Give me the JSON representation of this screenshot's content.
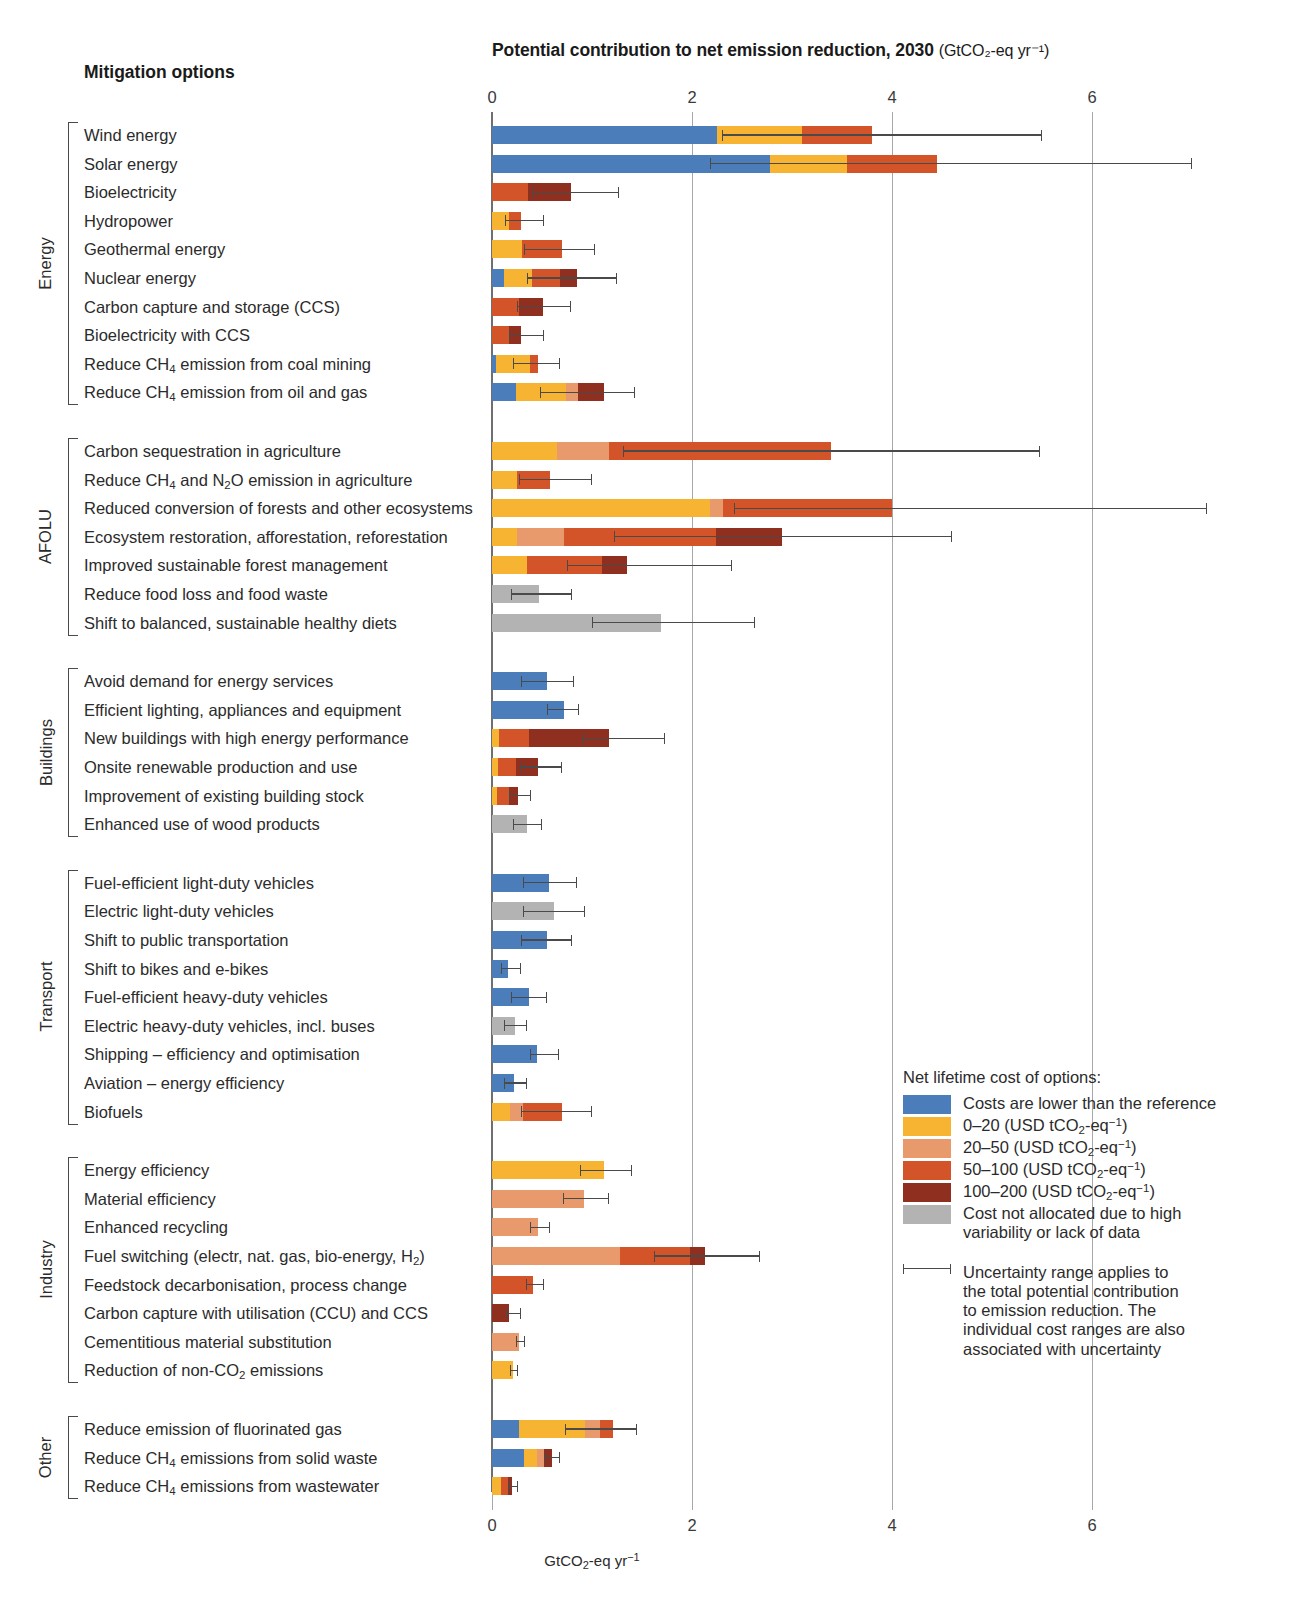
{
  "header": {
    "title_main": "Potential contribution to net emission reduction, 2030",
    "title_unit": "(GtCO₂-eq yr⁻¹)",
    "column_header": "Mitigation options"
  },
  "axis": {
    "bottom_label": "GtCO₂-eq yr⁻¹",
    "ticks": [
      "0",
      "2",
      "4",
      "6"
    ],
    "tick_values": [
      0,
      2,
      4,
      6
    ],
    "xlim": [
      0,
      7.4
    ]
  },
  "colors": {
    "lower_than_reference": "#4a7dba",
    "cost_0_20": "#f6b432",
    "cost_20_50": "#e89a6d",
    "cost_50_100": "#d4542a",
    "cost_100_200": "#8e2f20",
    "not_allocated": "#b3b3b3",
    "error_bar": "#4a4a4a",
    "gridline": "#a8a8a8"
  },
  "legend": {
    "title": "Net lifetime cost of options:",
    "items": [
      {
        "key": "lower_than_reference",
        "label": "Costs are lower than the reference"
      },
      {
        "key": "cost_0_20",
        "label": "0–20 (USD tCO₂-eq⁻¹)"
      },
      {
        "key": "cost_20_50",
        "label": "20–50 (USD tCO₂-eq⁻¹)"
      },
      {
        "key": "cost_50_100",
        "label": "50–100 (USD tCO₂-eq⁻¹)"
      },
      {
        "key": "cost_100_200",
        "label": "100–200 (USD tCO₂-eq⁻¹)"
      },
      {
        "key": "not_allocated",
        "label": "Cost not allocated due to high variability or lack of data"
      }
    ],
    "uncertainty_note": "Uncertainty range applies to the total potential contribution to emission reduction. The individual cost ranges are also associated with uncertainty"
  },
  "chart_data": {
    "type": "bar",
    "orientation": "horizontal",
    "stacked": true,
    "xlabel": "GtCO2-eq yr-1",
    "ylabel": "Mitigation options",
    "xlim": [
      0,
      7.4
    ],
    "grid": "vertical",
    "legend_position": "bottom-right",
    "series": [
      {
        "name": "Costs are lower than the reference",
        "color": "#4a7dba"
      },
      {
        "name": "0–20 (USD tCO2-eq-1)",
        "color": "#f6b432"
      },
      {
        "name": "20–50 (USD tCO2-eq-1)",
        "color": "#e89a6d"
      },
      {
        "name": "50–100 (USD tCO2-eq-1)",
        "color": "#d4542a"
      },
      {
        "name": "100–200 (USD tCO2-eq-1)",
        "color": "#8e2f20"
      },
      {
        "name": "Cost not allocated due to high variability or lack of data",
        "color": "#b3b3b3"
      }
    ],
    "groups": [
      {
        "name": "Energy",
        "options": [
          {
            "label": "Wind energy",
            "segments": [
              [
                "lower_than_reference",
                2.25
              ],
              [
                "cost_0_20",
                0.85
              ],
              [
                "cost_50_100",
                0.7
              ]
            ],
            "total": 3.8,
            "err_low": 2.3,
            "err_high": 5.5
          },
          {
            "label": "Solar energy",
            "segments": [
              [
                "lower_than_reference",
                2.78
              ],
              [
                "cost_0_20",
                0.77
              ],
              [
                "cost_50_100",
                0.9
              ]
            ],
            "total": 4.45,
            "err_low": 2.18,
            "err_high": 7.0
          },
          {
            "label": "Bioelectricity",
            "segments": [
              [
                "cost_50_100",
                0.36
              ],
              [
                "cost_100_200",
                0.43
              ]
            ],
            "total": 0.79,
            "err_low": 0.4,
            "err_high": 1.27
          },
          {
            "label": "Hydropower",
            "segments": [
              [
                "cost_0_20",
                0.17
              ],
              [
                "cost_50_100",
                0.12
              ]
            ],
            "total": 0.29,
            "err_low": 0.13,
            "err_high": 0.52
          },
          {
            "label": "Geothermal energy",
            "segments": [
              [
                "cost_0_20",
                0.3
              ],
              [
                "cost_50_100",
                0.4
              ]
            ],
            "total": 0.7,
            "err_low": 0.32,
            "err_high": 1.03
          },
          {
            "label": "Nuclear energy",
            "segments": [
              [
                "lower_than_reference",
                0.12
              ],
              [
                "cost_0_20",
                0.28
              ],
              [
                "cost_50_100",
                0.28
              ],
              [
                "cost_100_200",
                0.17
              ]
            ],
            "total": 0.85,
            "err_low": 0.35,
            "err_high": 1.25
          },
          {
            "label": "Carbon capture and storage (CCS)",
            "segments": [
              [
                "cost_50_100",
                0.27
              ],
              [
                "cost_100_200",
                0.24
              ]
            ],
            "total": 0.51,
            "err_low": 0.25,
            "err_high": 0.79
          },
          {
            "label": "Bioelectricity with CCS",
            "segments": [
              [
                "cost_50_100",
                0.17
              ],
              [
                "cost_100_200",
                0.12
              ]
            ],
            "total": 0.29,
            "err_low": 0.17,
            "err_high": 0.52
          },
          {
            "label": "Reduce CH₄ emission from coal mining",
            "segments": [
              [
                "lower_than_reference",
                0.04
              ],
              [
                "cost_0_20",
                0.34
              ],
              [
                "cost_50_100",
                0.08
              ]
            ],
            "total": 0.46,
            "err_low": 0.21,
            "err_high": 0.68
          },
          {
            "label": "Reduce CH₄ emission from oil and gas",
            "segments": [
              [
                "lower_than_reference",
                0.24
              ],
              [
                "cost_0_20",
                0.5
              ],
              [
                "cost_20_50",
                0.12
              ],
              [
                "cost_100_200",
                0.26
              ]
            ],
            "total": 1.12,
            "err_low": 0.48,
            "err_high": 1.43
          }
        ]
      },
      {
        "name": "AFOLU",
        "options": [
          {
            "label": "Carbon sequestration in agriculture",
            "segments": [
              [
                "cost_0_20",
                0.65
              ],
              [
                "cost_20_50",
                0.52
              ],
              [
                "cost_50_100",
                2.22
              ]
            ],
            "total": 3.39,
            "err_low": 1.31,
            "err_high": 5.48
          },
          {
            "label": "Reduce CH₄ and N₂O emission in agriculture",
            "segments": [
              [
                "cost_0_20",
                0.25
              ],
              [
                "cost_50_100",
                0.33
              ]
            ],
            "total": 0.58,
            "err_low": 0.27,
            "err_high": 1.0
          },
          {
            "label": "Reduced conversion of forests and other ecosystems",
            "segments": [
              [
                "cost_0_20",
                2.18
              ],
              [
                "cost_20_50",
                0.13
              ],
              [
                "cost_50_100",
                1.69
              ]
            ],
            "total": 4.0,
            "err_low": 2.42,
            "err_high": 7.15
          },
          {
            "label": "Ecosystem restoration, afforestation, reforestation",
            "segments": [
              [
                "cost_0_20",
                0.25
              ],
              [
                "cost_20_50",
                0.47
              ],
              [
                "cost_50_100",
                1.52
              ],
              [
                "cost_100_200",
                0.66
              ]
            ],
            "total": 2.9,
            "err_low": 1.22,
            "err_high": 4.6
          },
          {
            "label": "Improved sustainable forest management",
            "segments": [
              [
                "cost_0_20",
                0.35
              ],
              [
                "cost_50_100",
                0.75
              ],
              [
                "cost_100_200",
                0.25
              ]
            ],
            "total": 1.35,
            "err_low": 0.75,
            "err_high": 2.4
          },
          {
            "label": "Reduce food loss and food waste",
            "segments": [
              [
                "not_allocated",
                0.47
              ]
            ],
            "total": 0.47,
            "err_low": 0.19,
            "err_high": 0.8
          },
          {
            "label": "Shift to balanced, sustainable healthy diets",
            "segments": [
              [
                "not_allocated",
                1.69
              ]
            ],
            "total": 1.69,
            "err_low": 1.0,
            "err_high": 2.63
          }
        ]
      },
      {
        "name": "Buildings",
        "options": [
          {
            "label": "Avoid demand for energy services",
            "segments": [
              [
                "lower_than_reference",
                0.55
              ]
            ],
            "total": 0.55,
            "err_low": 0.29,
            "err_high": 0.82
          },
          {
            "label": "Efficient lighting, appliances and equipment",
            "segments": [
              [
                "lower_than_reference",
                0.72
              ]
            ],
            "total": 0.72,
            "err_low": 0.55,
            "err_high": 0.87
          },
          {
            "label": "New buildings with high energy performance",
            "segments": [
              [
                "cost_0_20",
                0.07
              ],
              [
                "cost_50_100",
                0.3
              ],
              [
                "cost_100_200",
                0.8
              ]
            ],
            "total": 1.17,
            "err_low": 0.9,
            "err_high": 1.73
          },
          {
            "label": "Onsite renewable production and use",
            "segments": [
              [
                "cost_0_20",
                0.06
              ],
              [
                "cost_50_100",
                0.18
              ],
              [
                "cost_100_200",
                0.22
              ]
            ],
            "total": 0.46,
            "err_low": 0.28,
            "err_high": 0.7
          },
          {
            "label": "Improvement of existing building stock",
            "segments": [
              [
                "cost_0_20",
                0.05
              ],
              [
                "cost_50_100",
                0.12
              ],
              [
                "cost_100_200",
                0.09
              ]
            ],
            "total": 0.26,
            "err_low": 0.17,
            "err_high": 0.39
          },
          {
            "label": "Enhanced use of wood products",
            "segments": [
              [
                "not_allocated",
                0.35
              ]
            ],
            "total": 0.35,
            "err_low": 0.21,
            "err_high": 0.5
          }
        ]
      },
      {
        "name": "Transport",
        "options": [
          {
            "label": "Fuel-efficient light-duty vehicles",
            "segments": [
              [
                "lower_than_reference",
                0.57
              ]
            ],
            "total": 0.57,
            "err_low": 0.31,
            "err_high": 0.85
          },
          {
            "label": "Electric light-duty vehicles",
            "segments": [
              [
                "not_allocated",
                0.62
              ]
            ],
            "total": 0.62,
            "err_low": 0.31,
            "err_high": 0.93
          },
          {
            "label": "Shift to public transportation",
            "segments": [
              [
                "lower_than_reference",
                0.55
              ]
            ],
            "total": 0.55,
            "err_low": 0.29,
            "err_high": 0.8
          },
          {
            "label": "Shift to bikes and e-bikes",
            "segments": [
              [
                "lower_than_reference",
                0.16
              ]
            ],
            "total": 0.16,
            "err_low": 0.09,
            "err_high": 0.29
          },
          {
            "label": "Fuel-efficient heavy-duty vehicles",
            "segments": [
              [
                "lower_than_reference",
                0.37
              ]
            ],
            "total": 0.37,
            "err_low": 0.19,
            "err_high": 0.55
          },
          {
            "label": "Electric heavy-duty vehicles, incl. buses",
            "segments": [
              [
                "not_allocated",
                0.23
              ]
            ],
            "total": 0.23,
            "err_low": 0.12,
            "err_high": 0.35
          },
          {
            "label": "Shipping – efficiency and optimisation",
            "segments": [
              [
                "lower_than_reference",
                0.45
              ]
            ],
            "total": 0.45,
            "err_low": 0.38,
            "err_high": 0.67
          },
          {
            "label": "Aviation – energy efficiency",
            "segments": [
              [
                "lower_than_reference",
                0.22
              ]
            ],
            "total": 0.22,
            "err_low": 0.12,
            "err_high": 0.35
          },
          {
            "label": "Biofuels",
            "segments": [
              [
                "cost_0_20",
                0.18
              ],
              [
                "cost_20_50",
                0.13
              ],
              [
                "cost_50_100",
                0.39
              ]
            ],
            "total": 0.7,
            "err_low": 0.29,
            "err_high": 1.0
          }
        ]
      },
      {
        "name": "Industry",
        "options": [
          {
            "label": "Energy efficiency",
            "segments": [
              [
                "cost_0_20",
                1.12
              ]
            ],
            "total": 1.12,
            "err_low": 0.88,
            "err_high": 1.4
          },
          {
            "label": "Material efficiency",
            "segments": [
              [
                "cost_20_50",
                0.92
              ]
            ],
            "total": 0.92,
            "err_low": 0.71,
            "err_high": 1.17
          },
          {
            "label": "Enhanced recycling",
            "segments": [
              [
                "cost_20_50",
                0.46
              ]
            ],
            "total": 0.46,
            "err_low": 0.38,
            "err_high": 0.58
          },
          {
            "label": "Fuel switching (electr, nat. gas, bio-energy, H₂)",
            "segments": [
              [
                "cost_20_50",
                1.28
              ],
              [
                "cost_50_100",
                0.7
              ],
              [
                "cost_100_200",
                0.15
              ]
            ],
            "total": 2.13,
            "err_low": 1.62,
            "err_high": 2.68
          },
          {
            "label": "Feedstock decarbonisation, process change",
            "segments": [
              [
                "cost_50_100",
                0.41
              ]
            ],
            "total": 0.41,
            "err_low": 0.34,
            "err_high": 0.52
          },
          {
            "label": "Carbon capture with utilisation (CCU) and CCS",
            "segments": [
              [
                "cost_100_200",
                0.17
              ]
            ],
            "total": 0.17,
            "err_low": 0.14,
            "err_high": 0.29
          },
          {
            "label": "Cementitious material substitution",
            "segments": [
              [
                "cost_20_50",
                0.27
              ]
            ],
            "total": 0.27,
            "err_low": 0.24,
            "err_high": 0.33
          },
          {
            "label": "Reduction of non-CO₂ emissions",
            "segments": [
              [
                "cost_0_20",
                0.21
              ]
            ],
            "total": 0.21,
            "err_low": 0.18,
            "err_high": 0.26
          }
        ]
      },
      {
        "name": "Other",
        "options": [
          {
            "label": "Reduce emission of fluorinated gas",
            "segments": [
              [
                "lower_than_reference",
                0.27
              ],
              [
                "cost_0_20",
                0.66
              ],
              [
                "cost_20_50",
                0.15
              ],
              [
                "cost_50_100",
                0.13
              ]
            ],
            "total": 1.21,
            "err_low": 0.73,
            "err_high": 1.45
          },
          {
            "label": "Reduce CH₄ emissions from solid waste",
            "segments": [
              [
                "lower_than_reference",
                0.32
              ],
              [
                "cost_0_20",
                0.13
              ],
              [
                "cost_20_50",
                0.07
              ],
              [
                "cost_100_200",
                0.08
              ]
            ],
            "total": 0.6,
            "err_low": 0.53,
            "err_high": 0.68
          },
          {
            "label": "Reduce CH₄ emissions from wastewater",
            "segments": [
              [
                "cost_0_20",
                0.09
              ],
              [
                "cost_50_100",
                0.07
              ],
              [
                "cost_100_200",
                0.04
              ]
            ],
            "total": 0.2,
            "err_low": 0.16,
            "err_high": 0.26
          }
        ]
      }
    ]
  }
}
